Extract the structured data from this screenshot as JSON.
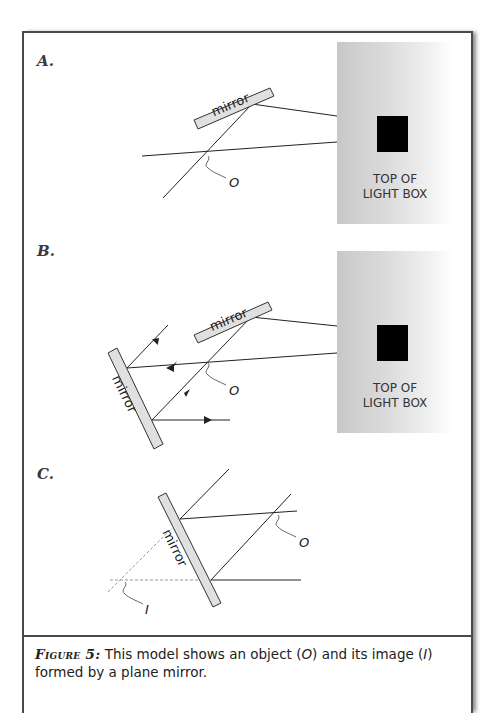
{
  "figure": {
    "panels": [
      {
        "label": "A.",
        "light_box": {
          "line1": "TOP OF",
          "line2": "LIGHT BOX"
        },
        "mirror_labels": [
          "mirror"
        ],
        "object_label": "O"
      },
      {
        "label": "B.",
        "light_box": {
          "line1": "TOP OF",
          "line2": "LIGHT BOX"
        },
        "mirror_labels": [
          "mirror",
          "mirror"
        ],
        "object_label": "O"
      },
      {
        "label": "C.",
        "mirror_labels": [
          "mirror"
        ],
        "object_label": "O",
        "image_label": "I"
      }
    ],
    "caption": {
      "figure_tag": "Figure 5:",
      "text_1": " This model shows an object (",
      "object": "O",
      "text_2": ") and its image (",
      "image": "I",
      "text_3": ") formed by a plane mirror."
    },
    "colors": {
      "frame": "#4a4a4a",
      "mirror_fill": "#e0e0e0",
      "line": "#222222",
      "dashed": "#999999"
    }
  }
}
